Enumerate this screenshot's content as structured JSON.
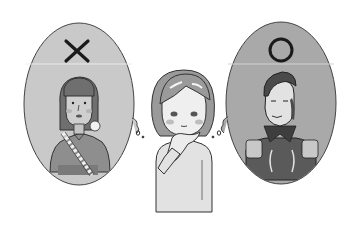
{
  "illustration": {
    "left_bubble": {
      "mark": "×",
      "mark_meaning": "wrong",
      "subject": "woman with long straight hair, bangs, earring, patterned sash",
      "background_color": "#c9c9c9"
    },
    "right_bubble": {
      "mark": "○",
      "mark_meaning": "correct",
      "subject": "man in military uniform with epaulettes and high embroidered collar",
      "background_color": "#a9a9a9"
    },
    "center_figure": {
      "subject": "woman with bob haircut, hand on chin, thinking"
    },
    "colors": {
      "outline": "#333333",
      "divider": "#e6e6e6",
      "skin": "#e8e8e8",
      "sweater": "#e2e2e2"
    }
  }
}
